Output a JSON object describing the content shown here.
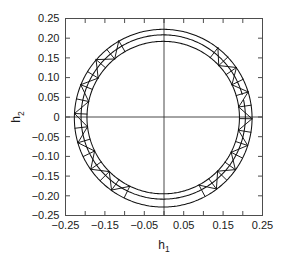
{
  "chart_data": {
    "type": "line",
    "title": "",
    "xlabel": "h_1",
    "ylabel": "h_2",
    "xlabel_base": "h",
    "xlabel_sub": "1",
    "ylabel_base": "h",
    "ylabel_sub": "2",
    "xlim": [
      -0.25,
      0.25
    ],
    "ylim": [
      -0.25,
      0.25
    ],
    "xticks": [
      -0.25,
      -0.15,
      -0.05,
      0.05,
      0.15,
      0.25
    ],
    "xtick_labels": [
      "-0.25",
      "-0.15",
      "-0.05",
      "0.05",
      "0.15",
      "0.25"
    ],
    "xtick_minor": [
      -0.2,
      -0.1,
      0.0,
      0.1,
      0.2
    ],
    "yticks": [
      0.25,
      0.2,
      0.15,
      0.1,
      0.05,
      0,
      -0.05,
      -0.1,
      -0.15,
      -0.2,
      -0.25
    ],
    "ytick_labels": [
      "0.25",
      "0.20",
      "0.15",
      "0.10",
      "0.05",
      "0",
      "-0.05",
      "-0.10",
      "-0.15",
      "-0.20",
      "-0.25"
    ],
    "grid": false,
    "legend": "none",
    "zero_lines": true,
    "series": [
      {
        "name": "outer trajectory",
        "shape": "circle",
        "center": [
          -0.002,
          -0.003
        ],
        "radius": 0.2255,
        "note": "outermost near-circular orbit, peak y 0.222, trough y -0.228"
      },
      {
        "name": "middle trajectory",
        "shape": "circle",
        "center": [
          -0.002,
          0.0
        ],
        "radius": 0.2085,
        "note": "intermediate orbit, peak y 0.208, trough y -0.205, open gap near upper right"
      },
      {
        "name": "inner trajectory",
        "shape": "circle",
        "center": [
          -0.002,
          -0.0015
        ],
        "radius": 0.1935,
        "note": "innermost orbit, peak y 0.192, trough y -0.195"
      }
    ],
    "mesh": {
      "name": "triangulated band",
      "inner_radius": 0.1935,
      "outer_radius": 0.2255,
      "center": [
        -0.002,
        -0.002
      ],
      "sectors": [
        {
          "name": "right-flank",
          "start_deg": -62,
          "end_deg": 52,
          "segments": 13
        },
        {
          "name": "left-flank",
          "start_deg": 120,
          "end_deg": 244,
          "segments": 13
        }
      ],
      "pattern": "alternating zigzag triangles between inner and outer arcs"
    },
    "extrema": {
      "x_max": 0.2235,
      "x_min": -0.2275,
      "y_max": 0.222,
      "y_min": -0.228
    }
  }
}
